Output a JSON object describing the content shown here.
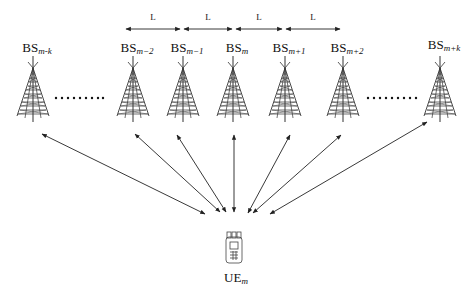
{
  "diagram": {
    "type": "network-topology",
    "spacing_label": "L",
    "spacing_segments": [
      {
        "x1": 126,
        "x2": 180,
        "label": "L"
      },
      {
        "x1": 184,
        "x2": 232,
        "label": "L"
      },
      {
        "x1": 236,
        "x2": 282,
        "label": "L"
      },
      {
        "x1": 286,
        "x2": 340,
        "label": "L"
      }
    ],
    "base_stations": [
      {
        "id": "bs-m-k",
        "base": "BS",
        "sub": "m-k",
        "x": 33
      },
      {
        "id": "bs-m-2",
        "base": "BS",
        "sub": "m−2",
        "x": 133
      },
      {
        "id": "bs-m-1",
        "base": "BS",
        "sub": "m−1",
        "x": 183
      },
      {
        "id": "bs-m",
        "base": "BS",
        "sub": "m",
        "x": 233
      },
      {
        "id": "bs-m+1",
        "base": "BS",
        "sub": "m+1",
        "x": 285
      },
      {
        "id": "bs-m+2",
        "base": "BS",
        "sub": "m+2",
        "x": 343
      },
      {
        "id": "bs-m+k",
        "base": "BS",
        "sub": "m+k",
        "x": 440
      }
    ],
    "ellipses": [
      {
        "x1": 55,
        "x2": 103,
        "y": 98
      },
      {
        "x1": 366,
        "x2": 418,
        "y": 98
      }
    ],
    "user_equipment": {
      "base": "UE",
      "sub": "m",
      "x": 233,
      "y": 255
    },
    "links": [
      {
        "from": "bs-m-k",
        "to_x": 205,
        "to_y": 214
      },
      {
        "from": "bs-m-2",
        "to_x": 220,
        "to_y": 212
      },
      {
        "from": "bs-m-1",
        "to_x": 226,
        "to_y": 212
      },
      {
        "from": "bs-m",
        "to_x": 234,
        "to_y": 212
      },
      {
        "from": "bs-m+1",
        "to_x": 248,
        "to_y": 213
      },
      {
        "from": "bs-m+2",
        "to_x": 253,
        "to_y": 213
      },
      {
        "from": "bs-m+k",
        "to_x": 270,
        "to_y": 214
      }
    ],
    "colors": {
      "line": "#222222",
      "background": "#ffffff"
    }
  }
}
